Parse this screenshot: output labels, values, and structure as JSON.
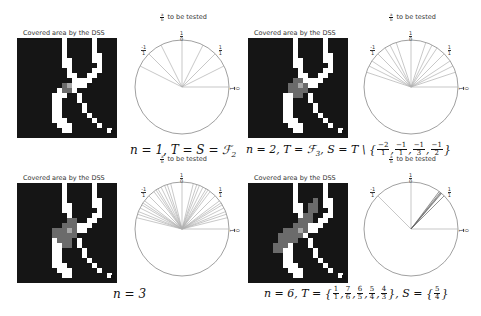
{
  "grid_title": "Covered area by the DSS",
  "circle_title": "a/b to be tested",
  "circle_title_frac": {
    "num": "a",
    "den": "b"
  },
  "tick_labels": {
    "top": {
      "num": "1",
      "den": "0"
    },
    "top_left": {
      "num": "-1",
      "den": "1"
    },
    "top_right": {
      "num": "1",
      "den": "1"
    },
    "right": {
      "num": "0",
      "den": "1"
    }
  },
  "colors": {
    "obstacle": "#151515",
    "free": "#ffffff",
    "covered": "#6b6b6b",
    "center": "#a8a8a8",
    "ray": "#b0b0b0",
    "ray_dark": "#666666",
    "circle": "#888888"
  },
  "base_map": [
    "11111111101111101111",
    "11111111101111101111",
    "11111111101111101111",
    "11111111101111100111",
    "11111111100111100111",
    "11111111100111110111",
    "11111111110111100111",
    "11111111110011001111",
    "11111111111000011111",
    "11111111110000111111",
    "11111111000011111111",
    "11111110001101111111",
    "11111110011101111111",
    "11111110011110111111",
    "11111110011110111111",
    "11111110011111011111",
    "11111110001111101111",
    "11111111000111110111",
    "11111111100111111101",
    "11111111111111111111"
  ],
  "panels": [
    {
      "id": "n1",
      "caption_parts": [
        "n = 1, T = S = ℱ",
        "2"
      ],
      "caption_text": "n = 1, T = S = F_2",
      "covered_cells": [
        [
          9,
          9
        ],
        [
          9,
          10
        ],
        [
          10,
          9
        ],
        [
          10,
          10
        ]
      ],
      "center_cell": [
        9,
        10
      ],
      "rays_deg": [
        90,
        45,
        135,
        26.6,
        153.4,
        63.4,
        116.6,
        0,
        180
      ],
      "rays_dark_deg": [],
      "visible_rays_deg": [
        0,
        26.6,
        45,
        63.4,
        90,
        116.6,
        135,
        153.4
      ]
    },
    {
      "id": "n2",
      "caption_parts": [
        "n = 2, T = ℱ",
        "3",
        ", S = T \\ {",
        "}"
      ],
      "caption_text": "n = 2, T = F_3, S = T \\ {-2/1, -1/1, -1/3, -1/2}",
      "caption_fracs": [
        {
          "num": "−2",
          "den": "1"
        },
        {
          "num": "−1",
          "den": "1"
        },
        {
          "num": "−1",
          "den": "3"
        },
        {
          "num": "−1",
          "den": "2"
        }
      ],
      "covered_cells": [
        [
          8,
          9
        ],
        [
          8,
          10
        ],
        [
          9,
          8
        ],
        [
          9,
          9
        ],
        [
          9,
          10
        ],
        [
          9,
          11
        ],
        [
          10,
          8
        ],
        [
          10,
          9
        ],
        [
          10,
          10
        ],
        [
          10,
          11
        ],
        [
          11,
          9
        ],
        [
          11,
          10
        ]
      ],
      "center_cell": [
        9,
        10
      ],
      "visible_rays_deg": [
        0,
        18.4,
        26.6,
        33.7,
        45,
        56.3,
        63.4,
        71.6,
        90,
        108.4,
        116.6,
        123.7,
        135,
        146.3,
        153.4,
        161.6
      ]
    },
    {
      "id": "n3",
      "caption_parts": [
        "n = 3"
      ],
      "caption_text": "n = 3",
      "covered_cells": [
        [
          7,
          10
        ],
        [
          7,
          11
        ],
        [
          8,
          9
        ],
        [
          8,
          10
        ],
        [
          8,
          11
        ],
        [
          9,
          7
        ],
        [
          9,
          8
        ],
        [
          9,
          9
        ],
        [
          9,
          10
        ],
        [
          9,
          11
        ],
        [
          10,
          7
        ],
        [
          10,
          8
        ],
        [
          10,
          9
        ],
        [
          10,
          10
        ],
        [
          10,
          11
        ],
        [
          11,
          8
        ],
        [
          11,
          9
        ],
        [
          11,
          10
        ],
        [
          12,
          9
        ],
        [
          12,
          10
        ]
      ],
      "center_cell": [
        9,
        10
      ],
      "visible_rays_deg": [
        0,
        14.0,
        18.4,
        21.8,
        26.6,
        30.96,
        33.7,
        36.9,
        45,
        53.1,
        56.3,
        59.0,
        63.4,
        68.2,
        71.6,
        76.0,
        90,
        104.0,
        108.4,
        111.8,
        116.6,
        121.0,
        123.7,
        126.9,
        135,
        143.1,
        146.3,
        149.0,
        153.4,
        158.2,
        161.6,
        166.0
      ]
    },
    {
      "id": "n6",
      "caption_parts": [
        "n = 6, T = {",
        "}, S = {",
        "}"
      ],
      "caption_text": "n = 6, T = {1/1, 7/6, 6/5, 5/4, 4/3}, S = {5/4}",
      "caption_fracs_T": [
        {
          "num": "1",
          "den": "1"
        },
        {
          "num": "7",
          "den": "6"
        },
        {
          "num": "6",
          "den": "5"
        },
        {
          "num": "5",
          "den": "4"
        },
        {
          "num": "4",
          "den": "3"
        }
      ],
      "caption_fracs_S": [
        {
          "num": "5",
          "den": "4"
        }
      ],
      "covered_cells": [
        [
          3,
          13
        ],
        [
          4,
          12
        ],
        [
          4,
          13
        ],
        [
          5,
          12
        ],
        [
          5,
          13
        ],
        [
          6,
          11
        ],
        [
          6,
          12
        ],
        [
          7,
          10
        ],
        [
          7,
          11
        ],
        [
          7,
          12
        ],
        [
          8,
          9
        ],
        [
          8,
          10
        ],
        [
          8,
          11
        ],
        [
          9,
          7
        ],
        [
          9,
          8
        ],
        [
          9,
          9
        ],
        [
          9,
          10
        ],
        [
          9,
          11
        ],
        [
          10,
          6
        ],
        [
          10,
          7
        ],
        [
          10,
          8
        ],
        [
          10,
          9
        ],
        [
          10,
          10
        ],
        [
          11,
          6
        ],
        [
          11,
          7
        ],
        [
          11,
          8
        ],
        [
          11,
          9
        ],
        [
          12,
          5
        ],
        [
          12,
          6
        ],
        [
          12,
          7
        ],
        [
          13,
          5
        ],
        [
          13,
          6
        ]
      ],
      "center_cell": [
        9,
        10
      ],
      "visible_rays_deg": [
        0,
        90,
        135
      ],
      "dark_rays_deg": [
        45,
        49.4,
        50.2,
        51.3,
        53.1
      ]
    }
  ]
}
